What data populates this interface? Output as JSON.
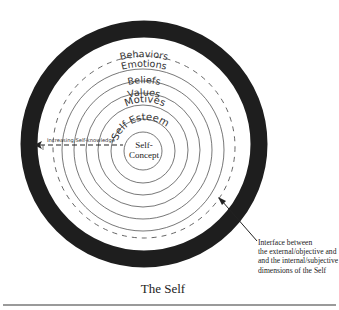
{
  "diagram": {
    "title": "The Self",
    "outer_ring_color": "#1e1e1e",
    "layers": [
      {
        "id": "behaviors",
        "label": "Behaviors",
        "style": "dashed"
      },
      {
        "id": "emotions",
        "label": "Emotions",
        "style": "solid"
      },
      {
        "id": "beliefs",
        "label": "Beliefs",
        "style": "solid"
      },
      {
        "id": "values",
        "label": "Values",
        "style": "solid"
      },
      {
        "id": "motives",
        "label": "Motives",
        "style": "solid"
      },
      {
        "id": "self-esteem",
        "label": "Self Esteem",
        "style": "solid"
      },
      {
        "id": "self-concept",
        "label_line1": "Self-",
        "label_line2": "Concept",
        "style": "solid"
      }
    ],
    "arrow_label": "Increasing Self-knowledge",
    "annotation": {
      "line1": "Interface between",
      "line2": "the external/objective and",
      "line3": "and the internal/subjective",
      "line4": "dimensions of the Self"
    }
  }
}
